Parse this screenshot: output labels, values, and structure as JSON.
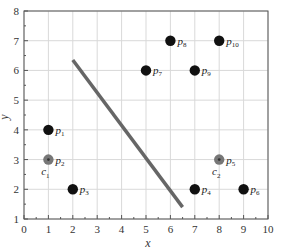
{
  "chart_data": {
    "type": "scatter",
    "title": "",
    "xlabel": "x",
    "ylabel": "y",
    "xlim": [
      0,
      10
    ],
    "ylim": [
      1,
      8
    ],
    "xticks": [
      0,
      1,
      2,
      3,
      4,
      5,
      6,
      7,
      8,
      9,
      10
    ],
    "yticks": [
      1,
      2,
      3,
      4,
      5,
      6,
      7,
      8
    ],
    "grid": true,
    "legend": null,
    "points": [
      {
        "name": "p1",
        "x": 1,
        "y": 4,
        "style": "black"
      },
      {
        "name": "p2",
        "x": 1,
        "y": 3,
        "style": "gray-center",
        "center_label": "c1"
      },
      {
        "name": "p3",
        "x": 2,
        "y": 2,
        "style": "black"
      },
      {
        "name": "p4",
        "x": 7,
        "y": 2,
        "style": "black"
      },
      {
        "name": "p5",
        "x": 8,
        "y": 3,
        "style": "gray-center",
        "center_label": "c2"
      },
      {
        "name": "p6",
        "x": 9,
        "y": 2,
        "style": "black"
      },
      {
        "name": "p7",
        "x": 5,
        "y": 6,
        "style": "black"
      },
      {
        "name": "p8",
        "x": 6,
        "y": 7,
        "style": "black"
      },
      {
        "name": "p9",
        "x": 7,
        "y": 6,
        "style": "black"
      },
      {
        "name": "p10",
        "x": 8,
        "y": 7,
        "style": "black"
      }
    ],
    "line": {
      "x1": 2.0,
      "y1": 6.35,
      "x2": 6.5,
      "y2": 1.4,
      "color": "#666666",
      "description": "separating line"
    },
    "colors": {
      "point": "#111111",
      "center_outer": "#777777",
      "center_inner": "#333333",
      "grid": "#d9d9d9",
      "frame": "#555555"
    }
  }
}
